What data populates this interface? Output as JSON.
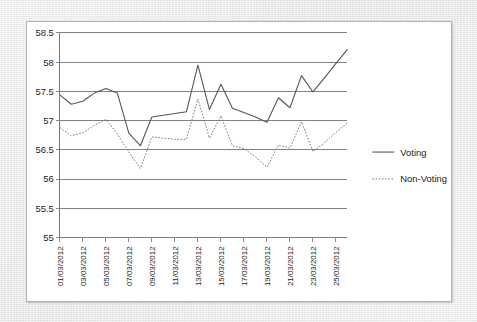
{
  "chart_data": {
    "type": "line",
    "title": "",
    "xlabel": "",
    "ylabel": "",
    "ylim": [
      55,
      58.5
    ],
    "yticks": [
      "55",
      "55.5",
      "56",
      "56.5",
      "57",
      "57.5",
      "58",
      "58.5"
    ],
    "ytick_values": [
      55,
      55.5,
      56,
      56.5,
      57,
      57.5,
      58,
      58.5
    ],
    "grid": true,
    "legend_position": "right",
    "x_tick_labels": [
      "01/03/2012",
      "03/03/2012",
      "05/03/2012",
      "07/03/2012",
      "09/03/2012",
      "11/03/2012",
      "13/03/2012",
      "15/03/2012",
      "17/03/2012",
      "19/03/2012",
      "21/03/2012",
      "23/03/2012",
      "25/03/2012"
    ],
    "x_label_step": 2,
    "x": [
      "01/03/2012",
      "02/03/2012",
      "03/03/2012",
      "04/03/2012",
      "05/03/2012",
      "06/03/2012",
      "07/03/2012",
      "08/03/2012",
      "09/03/2012",
      "10/03/2012",
      "11/03/2012",
      "12/03/2012",
      "13/03/2012",
      "14/03/2012",
      "15/03/2012",
      "16/03/2012",
      "17/03/2012",
      "18/03/2012",
      "19/03/2012",
      "20/03/2012",
      "21/03/2012",
      "22/03/2012",
      "23/03/2012",
      "24/03/2012",
      "25/03/2012",
      "26/03/2012"
    ],
    "series": [
      {
        "name": "Voting",
        "style": "solid",
        "color": "#555555",
        "values": [
          57.44,
          57.28,
          57.33,
          57.47,
          57.55,
          57.47,
          56.78,
          56.57,
          57.06,
          57.09,
          57.12,
          57.15,
          57.95,
          57.19,
          57.62,
          57.21,
          57.14,
          57.06,
          56.97,
          57.39,
          57.22,
          57.77,
          57.49,
          57.73,
          57.98,
          58.22
        ]
      },
      {
        "name": "Non-Voting",
        "style": "dotted",
        "color": "#777777",
        "values": [
          56.88,
          56.74,
          56.79,
          56.92,
          57.02,
          56.77,
          56.46,
          56.18,
          56.72,
          56.7,
          56.68,
          56.68,
          57.37,
          56.7,
          57.08,
          56.57,
          56.52,
          56.38,
          56.2,
          56.58,
          56.53,
          56.98,
          56.47,
          56.62,
          56.8,
          56.96
        ]
      }
    ]
  },
  "legend": {
    "items": [
      {
        "label": "Voting",
        "style": "solid"
      },
      {
        "label": "Non-Voting",
        "style": "dotted"
      }
    ]
  }
}
